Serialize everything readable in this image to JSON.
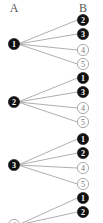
{
  "headers": {
    "left": "A",
    "right": "B"
  },
  "colors": {
    "filled": "#111111",
    "hollow_stroke": "#888888",
    "edge": "#9a9a9a"
  },
  "groups": [
    {
      "source": {
        "label": "1",
        "style": "filled"
      },
      "targets": [
        {
          "label": "2",
          "style": "filled"
        },
        {
          "label": "3",
          "style": "filled"
        },
        {
          "label": "4",
          "style": "hollow"
        },
        {
          "label": "5",
          "style": "hollow"
        }
      ]
    },
    {
      "source": {
        "label": "2",
        "style": "filled"
      },
      "targets": [
        {
          "label": "1",
          "style": "filled"
        },
        {
          "label": "3",
          "style": "filled"
        },
        {
          "label": "4",
          "style": "hollow"
        },
        {
          "label": "5",
          "style": "hollow"
        }
      ]
    },
    {
      "source": {
        "label": "3",
        "style": "filled"
      },
      "targets": [
        {
          "label": "1",
          "style": "filled"
        },
        {
          "label": "2",
          "style": "filled"
        },
        {
          "label": "4",
          "style": "hollow"
        },
        {
          "label": "5",
          "style": "hollow"
        }
      ]
    },
    {
      "source": {
        "label": "4",
        "style": "hollow"
      },
      "targets": [
        {
          "label": "1",
          "style": "filled"
        },
        {
          "label": "2",
          "style": "filled"
        }
      ]
    }
  ]
}
